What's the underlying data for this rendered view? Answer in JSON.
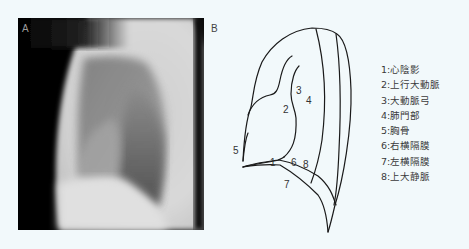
{
  "panels": {
    "a": {
      "label": "A",
      "content": "lateral chest radiograph"
    },
    "b": {
      "label": "B",
      "content": "schematic diagram of lateral chest radiograph"
    }
  },
  "diagram_labels": [
    {
      "num": "1",
      "x": 270,
      "y": 165
    },
    {
      "num": "2",
      "x": 284,
      "y": 113
    },
    {
      "num": "3",
      "x": 296,
      "y": 95
    },
    {
      "num": "4",
      "x": 307,
      "y": 104
    },
    {
      "num": "5",
      "x": 233,
      "y": 153
    },
    {
      "num": "6",
      "x": 292,
      "y": 166
    },
    {
      "num": "7",
      "x": 285,
      "y": 187
    },
    {
      "num": "8",
      "x": 304,
      "y": 168
    }
  ],
  "legend": {
    "items": [
      {
        "num": "1",
        "label": "心陰影"
      },
      {
        "num": "2",
        "label": "上行大動脈"
      },
      {
        "num": "3",
        "label": "大動脈弓"
      },
      {
        "num": "4",
        "label": "肺門部"
      },
      {
        "num": "5",
        "label": "胸骨"
      },
      {
        "num": "6",
        "label": "右横隔膜"
      },
      {
        "num": "7",
        "label": "左横隔膜"
      },
      {
        "num": "8",
        "label": "上大静脈"
      }
    ]
  },
  "colors": {
    "background": "#f2f9fb",
    "line": "#1a1a1a",
    "text": "#3a3a3a"
  }
}
